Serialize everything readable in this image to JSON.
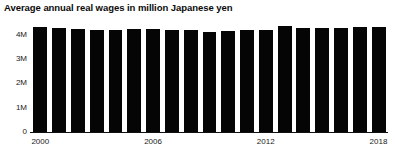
{
  "chart_data": {
    "type": "bar",
    "title": "Average annual real wages in million Japanese yen",
    "xlabel": "",
    "ylabel": "",
    "grid": false,
    "legend": "none",
    "ylim": [
      0,
      4800000
    ],
    "yticks": [
      {
        "value": 0,
        "label": "0"
      },
      {
        "value": 1000000,
        "label": "1M"
      },
      {
        "value": 2000000,
        "label": "2M"
      },
      {
        "value": 3000000,
        "label": "3M"
      },
      {
        "value": 4000000,
        "label": "4M"
      }
    ],
    "xtick_labels": [
      "2000",
      "2006",
      "2012",
      "2018"
    ],
    "xtick_categories": [
      "2000",
      "2006",
      "2012",
      "2018"
    ],
    "bar_color": "#050505",
    "background_color": "#ffffff",
    "axis_color": "#111111",
    "categories": [
      "2000",
      "2001",
      "2002",
      "2003",
      "2004",
      "2005",
      "2006",
      "2007",
      "2008",
      "2009",
      "2010",
      "2011",
      "2012",
      "2013",
      "2014",
      "2015",
      "2016",
      "2017",
      "2018"
    ],
    "values": [
      4330000,
      4300000,
      4255000,
      4220000,
      4245000,
      4270000,
      4265000,
      4240000,
      4235000,
      4160000,
      4205000,
      4230000,
      4215000,
      4390000,
      4320000,
      4300000,
      4310000,
      4330000,
      4340000
    ]
  }
}
